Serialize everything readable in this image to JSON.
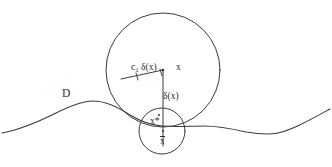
{
  "figure": {
    "kind": "hand-drawn-geometry-diagram",
    "background_color": "#ffffff",
    "ink_color": "#3a3a3a",
    "text_color": "#2f2f2f",
    "width": 332,
    "height": 167
  },
  "labels": {
    "domain": "D",
    "center_point": "x",
    "radius_label_symbol": "c",
    "radius_label_subscript": "1",
    "radius_label_value": " δ(x)",
    "distance": "δ(x)",
    "projection_point": "x*",
    "boundary_point": "x"
  },
  "geometry": {
    "outer_circle": {
      "cx": 163,
      "cy": 70,
      "r": 57
    },
    "inner_circle": {
      "cx": 162,
      "cy": 131,
      "r": 23
    },
    "vertical_segment": {
      "x": 163,
      "y1": 70,
      "y2": 144
    },
    "radius_segment": {
      "x1": 121,
      "y1": 78,
      "x2": 163,
      "y2": 70
    },
    "domain_curve": "wavy horizontal boundary from left edge to right edge"
  }
}
